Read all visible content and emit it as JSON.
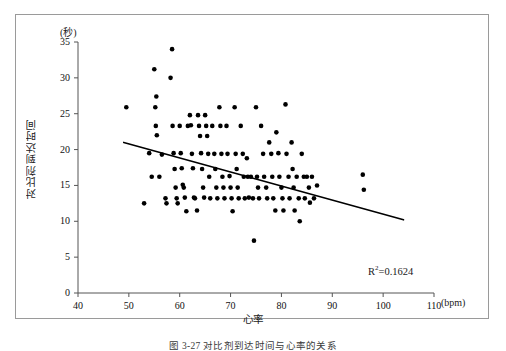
{
  "figure": {
    "caption": "图 3-27  对比剂到达时间与心率的关系",
    "frame_color": "#9a9a9a"
  },
  "axes": {
    "y_unit_label": "(秒)",
    "x_unit_label": "(bpm)",
    "x_title": "心率",
    "y_title": "对比剂到达时间",
    "y_ticks": [
      "0",
      "5",
      "10",
      "15",
      "20",
      "25",
      "30",
      "35"
    ],
    "x_ticks": [
      "40",
      "50",
      "60",
      "70",
      "80",
      "90",
      "100",
      "110"
    ]
  },
  "annotation": {
    "r_squared_prefix": "R",
    "r_squared_exponent": "2",
    "r_squared_value": "=0.1624",
    "r_squared_full": "R2=0.1624"
  },
  "chart_data": {
    "type": "scatter",
    "title": "",
    "subtitle": "",
    "xlabel": "心率",
    "ylabel": "对比剂到达时间",
    "x_unit": "bpm",
    "y_unit": "秒",
    "xlim": [
      40,
      110
    ],
    "ylim": [
      0,
      35
    ],
    "x_tick_values": [
      40,
      50,
      60,
      70,
      80,
      90,
      100,
      110
    ],
    "y_tick_values": [
      0,
      5,
      10,
      15,
      20,
      25,
      30,
      35
    ],
    "grid": false,
    "legend": false,
    "marker": {
      "shape": "circle",
      "color": "#000000",
      "size": 2.3
    },
    "annotations": [
      {
        "text": "R2=0.1624",
        "x": 97,
        "y": 3.4
      }
    ],
    "trendline": {
      "type": "linear",
      "color": "#000000",
      "width": 1.6,
      "x_start": 49.0,
      "y_start": 21.0,
      "x_end": 104.0,
      "y_end": 10.2,
      "slope": -0.196,
      "intercept": 30.6,
      "r_squared": 0.1624
    },
    "points": [
      [
        49.5,
        25.9
      ],
      [
        53.0,
        12.5
      ],
      [
        54.0,
        19.5
      ],
      [
        54.5,
        16.2
      ],
      [
        55.0,
        31.2
      ],
      [
        55.2,
        25.9
      ],
      [
        55.3,
        23.3
      ],
      [
        55.4,
        27.4
      ],
      [
        55.5,
        22.0
      ],
      [
        56.0,
        16.2
      ],
      [
        56.5,
        19.3
      ],
      [
        57.2,
        13.2
      ],
      [
        57.4,
        12.5
      ],
      [
        58.2,
        30.0
      ],
      [
        58.5,
        34.0
      ],
      [
        58.6,
        23.3
      ],
      [
        58.8,
        19.5
      ],
      [
        59.0,
        17.3
      ],
      [
        59.2,
        14.7
      ],
      [
        59.4,
        13.2
      ],
      [
        59.6,
        12.5
      ],
      [
        60.0,
        23.3
      ],
      [
        60.2,
        19.5
      ],
      [
        60.4,
        17.4
      ],
      [
        60.6,
        15.1
      ],
      [
        60.8,
        14.7
      ],
      [
        61.0,
        13.3
      ],
      [
        61.3,
        11.4
      ],
      [
        61.6,
        23.3
      ],
      [
        62.0,
        24.8
      ],
      [
        62.2,
        23.4
      ],
      [
        62.4,
        19.4
      ],
      [
        62.6,
        17.4
      ],
      [
        62.8,
        13.3
      ],
      [
        63.0,
        13.2
      ],
      [
        63.4,
        11.5
      ],
      [
        63.6,
        24.8
      ],
      [
        63.8,
        23.3
      ],
      [
        64.0,
        21.9
      ],
      [
        64.2,
        19.5
      ],
      [
        64.4,
        17.3
      ],
      [
        64.6,
        14.7
      ],
      [
        64.8,
        13.3
      ],
      [
        65.0,
        24.8
      ],
      [
        65.2,
        23.3
      ],
      [
        65.4,
        21.9
      ],
      [
        65.6,
        19.4
      ],
      [
        65.8,
        16.2
      ],
      [
        66.0,
        13.2
      ],
      [
        66.4,
        23.3
      ],
      [
        66.8,
        19.4
      ],
      [
        67.0,
        17.3
      ],
      [
        67.2,
        14.7
      ],
      [
        67.4,
        13.2
      ],
      [
        67.8,
        25.9
      ],
      [
        68.0,
        23.3
      ],
      [
        68.2,
        19.4
      ],
      [
        68.4,
        16.2
      ],
      [
        68.6,
        14.7
      ],
      [
        68.8,
        13.2
      ],
      [
        69.2,
        23.3
      ],
      [
        69.4,
        19.4
      ],
      [
        69.8,
        16.3
      ],
      [
        70.0,
        14.7
      ],
      [
        70.2,
        13.2
      ],
      [
        70.4,
        11.4
      ],
      [
        70.8,
        25.9
      ],
      [
        71.0,
        19.4
      ],
      [
        71.2,
        17.3
      ],
      [
        71.4,
        14.7
      ],
      [
        71.6,
        13.2
      ],
      [
        72.0,
        23.3
      ],
      [
        72.4,
        19.4
      ],
      [
        72.6,
        16.2
      ],
      [
        72.8,
        13.2
      ],
      [
        73.2,
        18.8
      ],
      [
        73.4,
        16.2
      ],
      [
        73.6,
        13.3
      ],
      [
        74.0,
        16.2
      ],
      [
        74.4,
        13.2
      ],
      [
        74.6,
        7.3
      ],
      [
        75.0,
        25.9
      ],
      [
        75.2,
        16.2
      ],
      [
        75.4,
        14.7
      ],
      [
        75.6,
        13.2
      ],
      [
        76.0,
        23.3
      ],
      [
        76.4,
        19.4
      ],
      [
        76.6,
        16.2
      ],
      [
        77.0,
        14.7
      ],
      [
        77.2,
        13.2
      ],
      [
        77.6,
        21.0
      ],
      [
        78.0,
        19.4
      ],
      [
        78.2,
        16.2
      ],
      [
        78.4,
        13.2
      ],
      [
        78.8,
        11.5
      ],
      [
        79.0,
        22.4
      ],
      [
        79.4,
        19.5
      ],
      [
        79.6,
        16.2
      ],
      [
        80.0,
        14.7
      ],
      [
        80.2,
        13.2
      ],
      [
        80.4,
        11.5
      ],
      [
        80.8,
        26.3
      ],
      [
        81.0,
        19.4
      ],
      [
        81.4,
        16.2
      ],
      [
        81.6,
        13.2
      ],
      [
        82.0,
        21.0
      ],
      [
        82.2,
        17.3
      ],
      [
        82.4,
        14.7
      ],
      [
        82.6,
        11.5
      ],
      [
        83.0,
        16.2
      ],
      [
        83.4,
        13.2
      ],
      [
        83.6,
        10.0
      ],
      [
        84.0,
        19.4
      ],
      [
        84.4,
        16.2
      ],
      [
        84.6,
        13.2
      ],
      [
        85.0,
        16.2
      ],
      [
        85.4,
        14.7
      ],
      [
        85.6,
        12.6
      ],
      [
        86.0,
        16.2
      ],
      [
        86.4,
        13.2
      ],
      [
        87.0,
        15.0
      ],
      [
        96.0,
        16.5
      ],
      [
        96.2,
        14.4
      ]
    ]
  }
}
